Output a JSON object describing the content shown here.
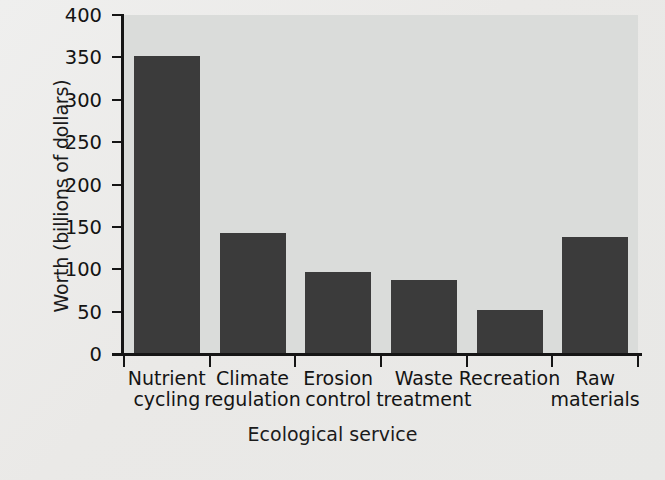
{
  "chart_data": {
    "type": "bar",
    "title": "",
    "xlabel": "Ecological service",
    "ylabel": "Worth (billions of dollars)",
    "categories": [
      "Nutrient cycling",
      "Climate regulation",
      "Erosion control",
      "Waste treatment",
      "Recreation",
      "Raw materials"
    ],
    "category_lines": [
      [
        "Nutrient",
        "cycling"
      ],
      [
        "Climate",
        "regulation"
      ],
      [
        "Erosion",
        "control"
      ],
      [
        "Waste",
        "treatment"
      ],
      [
        "Recreation",
        ""
      ],
      [
        "Raw",
        "materials"
      ]
    ],
    "values": [
      352,
      143,
      97,
      87,
      52,
      138
    ],
    "ylim": [
      0,
      400
    ],
    "yticks": [
      0,
      50,
      100,
      150,
      200,
      250,
      300,
      350,
      400
    ],
    "ytick_labels": [
      "0",
      "50",
      "100",
      "150",
      "200",
      "250",
      "300",
      "350",
      "400"
    ],
    "grid": false,
    "legend": null,
    "bar_color": "#3b3b3b",
    "plot_background": "#dadcda",
    "page_background": "#ececeb",
    "axis_color": "#151515"
  }
}
